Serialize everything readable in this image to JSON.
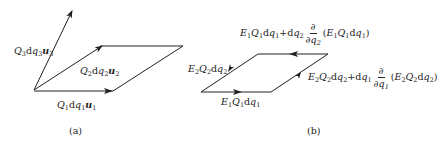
{
  "panel_a": {
    "caption": "(a)",
    "vectors": [
      {
        "id": "u1",
        "label_coef": "Q",
        "label_coef_sub": "1",
        "label_d": "d",
        "label_q": "q",
        "label_q_sub": "1",
        "label_vec": "u",
        "label_vec_sub": "1"
      },
      {
        "id": "u2",
        "label_coef": "Q",
        "label_coef_sub": "2",
        "label_d": "d",
        "label_q": "q",
        "label_q_sub": "2",
        "label_vec": "u",
        "label_vec_sub": "2"
      },
      {
        "id": "u3",
        "label_coef": "Q",
        "label_coef_sub": "3",
        "label_d": "d",
        "label_q": "q",
        "label_q_sub": "3",
        "label_vec": "u",
        "label_vec_sub": "3"
      }
    ]
  },
  "panel_b": {
    "caption": "(b)",
    "edges": {
      "bottom": {
        "E": "E",
        "E_sub": "1",
        "Q": "Q",
        "Q_sub": "1",
        "d": "d",
        "q": "q",
        "q_sub": "1"
      },
      "left": {
        "E": "E",
        "E_sub": "2",
        "Q": "Q",
        "Q_sub": "2",
        "d": "d",
        "q": "q",
        "q_sub": "2"
      },
      "top": {
        "E": "E",
        "E_sub": "1",
        "Q": "Q",
        "Q_sub": "1",
        "d": "d",
        "q": "q",
        "q_sub": "1",
        "plus": "+d",
        "dq": "q",
        "dq_sub": "2",
        "partial": "∂",
        "partial_den": "∂q",
        "partial_den_sub": "2",
        "paren_open": "(",
        "paren_close": ")"
      },
      "right": {
        "E": "E",
        "E_sub": "2",
        "Q": "Q",
        "Q_sub": "2",
        "d": "d",
        "q": "q",
        "q_sub": "2",
        "plus": "+d",
        "dq": "q",
        "dq_sub": "1",
        "partial": "∂",
        "partial_den": "∂q",
        "partial_den_sub": "1",
        "paren_open": "(",
        "paren_close": ")"
      }
    }
  },
  "colors": {
    "stroke": "#222222",
    "background": "#ffffff"
  }
}
